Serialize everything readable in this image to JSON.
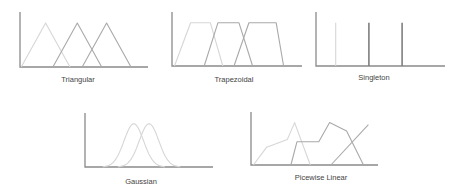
{
  "figure_title": "",
  "colors": {
    "light": "#d6d6d6",
    "medium": "#a9a9a9",
    "dark": "#7f7f7f",
    "axis": "#8a8a8a"
  },
  "chart_data": [
    {
      "id": "triangular",
      "type": "line",
      "title": "Triangular",
      "xlim": [
        0,
        10
      ],
      "ylim": [
        0,
        1.25
      ],
      "series": [
        {
          "name": "set-1",
          "shade": "light",
          "x": [
            0.1,
            2.1,
            4.1
          ],
          "y": [
            0,
            1,
            0
          ]
        },
        {
          "name": "set-2",
          "shade": "medium",
          "x": [
            2.7,
            4.7,
            6.7
          ],
          "y": [
            0,
            1,
            0
          ]
        },
        {
          "name": "set-3",
          "shade": "medium",
          "x": [
            5.1,
            7.1,
            9.1
          ],
          "y": [
            0,
            1,
            0
          ]
        }
      ]
    },
    {
      "id": "trapezoidal",
      "type": "line",
      "title": "Trapezoidal",
      "xlim": [
        0,
        10
      ],
      "ylim": [
        0,
        1.25
      ],
      "series": [
        {
          "name": "set-1",
          "shade": "light",
          "x": [
            0.2,
            1.5,
            3.1,
            4.1
          ],
          "y": [
            0,
            1,
            1,
            0
          ]
        },
        {
          "name": "set-2",
          "shade": "medium",
          "x": [
            2.6,
            3.7,
            5.4,
            6.5
          ],
          "y": [
            0,
            1,
            1,
            0
          ]
        },
        {
          "name": "set-3",
          "shade": "medium",
          "x": [
            5.0,
            6.2,
            8.4,
            9.0
          ],
          "y": [
            0,
            1,
            1,
            0
          ]
        }
      ]
    },
    {
      "id": "singleton",
      "type": "line",
      "title": "Singleton",
      "xlim": [
        0,
        10
      ],
      "ylim": [
        0,
        1.25
      ],
      "series": [
        {
          "name": "set-1",
          "shade": "light",
          "x": [
            1.6,
            1.6
          ],
          "y": [
            0,
            1
          ]
        },
        {
          "name": "set-2",
          "shade": "dark",
          "x": [
            4.3,
            4.3
          ],
          "y": [
            0,
            1
          ]
        },
        {
          "name": "set-3",
          "shade": "dark",
          "x": [
            7.0,
            7.0
          ],
          "y": [
            0,
            1
          ]
        }
      ]
    },
    {
      "id": "gaussian",
      "type": "line",
      "title": "Gaussian",
      "xlim": [
        0,
        10
      ],
      "ylim": [
        0,
        1.25
      ],
      "series": [
        {
          "name": "set-1",
          "shade": "light",
          "mean": 4.0,
          "sigma": 0.8
        },
        {
          "name": "set-2",
          "shade": "light",
          "mean": 5.25,
          "sigma": 0.8
        }
      ]
    },
    {
      "id": "piecewise-linear",
      "type": "line",
      "title": "Picewise Linear",
      "xlim": [
        0,
        10
      ],
      "ylim": [
        0,
        1.25
      ],
      "series": [
        {
          "name": "set-1",
          "shade": "light",
          "x": [
            0.2,
            1.3,
            3.0,
            3.6,
            4.9
          ],
          "y": [
            0,
            0.42,
            0.6,
            1.0,
            0.0
          ]
        },
        {
          "name": "set-2",
          "shade": "medium",
          "x": [
            3.3,
            3.8,
            5.6,
            6.5,
            7.9,
            9.3
          ],
          "y": [
            0,
            0.55,
            0.55,
            1.0,
            0.8,
            0.0
          ]
        },
        {
          "name": "set-3",
          "shade": "medium",
          "x": [
            6.6,
            9.7
          ],
          "y": [
            0,
            0.95
          ]
        }
      ]
    }
  ]
}
